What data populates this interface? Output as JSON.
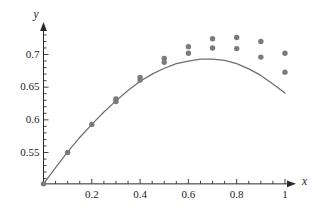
{
  "chart_data": {
    "type": "scatter",
    "title": "",
    "xlabel": "x",
    "ylabel": "y",
    "xlim": [
      0,
      1.06
    ],
    "ylim": [
      0.5,
      0.735
    ],
    "grid": false,
    "legend": null,
    "x_ticks": [
      0.2,
      0.4,
      0.6,
      0.8,
      1
    ],
    "x_tick_labels": [
      "0.2",
      "0.4",
      "0.6",
      "0.8",
      "1"
    ],
    "x_minor_step": 0.05,
    "y_ticks": [
      0.55,
      0.6,
      0.65,
      0.7
    ],
    "y_tick_labels": [
      "0.55",
      "0.6",
      "0.65",
      "0.7"
    ],
    "y_minor_step": 0.01,
    "marker_color": "#7a7a7a",
    "curve_color": "#6e6e6e",
    "axis_color": "#2b2b2b",
    "series": [
      {
        "name": "observed",
        "type": "scatter",
        "points": [
          [
            0.0,
            0.502
          ],
          [
            0.1,
            0.55
          ],
          [
            0.2,
            0.593
          ],
          [
            0.3,
            0.632
          ],
          [
            0.3,
            0.628
          ],
          [
            0.4,
            0.665
          ],
          [
            0.4,
            0.661
          ],
          [
            0.5,
            0.694
          ],
          [
            0.5,
            0.688
          ],
          [
            0.6,
            0.712
          ],
          [
            0.6,
            0.702
          ],
          [
            0.7,
            0.724
          ],
          [
            0.7,
            0.71
          ],
          [
            0.8,
            0.726
          ],
          [
            0.8,
            0.709
          ],
          [
            0.9,
            0.72
          ],
          [
            0.9,
            0.696
          ],
          [
            1.0,
            0.702
          ],
          [
            1.0,
            0.673
          ]
        ]
      },
      {
        "name": "fitted-curve",
        "type": "line",
        "points": [
          [
            0.0,
            0.502
          ],
          [
            0.05,
            0.527
          ],
          [
            0.1,
            0.551
          ],
          [
            0.15,
            0.573
          ],
          [
            0.2,
            0.593
          ],
          [
            0.25,
            0.612
          ],
          [
            0.3,
            0.629
          ],
          [
            0.35,
            0.645
          ],
          [
            0.4,
            0.659
          ],
          [
            0.45,
            0.67
          ],
          [
            0.5,
            0.679
          ],
          [
            0.55,
            0.686
          ],
          [
            0.6,
            0.69
          ],
          [
            0.65,
            0.693
          ],
          [
            0.7,
            0.693
          ],
          [
            0.75,
            0.691
          ],
          [
            0.8,
            0.686
          ],
          [
            0.85,
            0.678
          ],
          [
            0.9,
            0.668
          ],
          [
            0.95,
            0.655
          ],
          [
            1.0,
            0.641
          ]
        ]
      }
    ]
  }
}
